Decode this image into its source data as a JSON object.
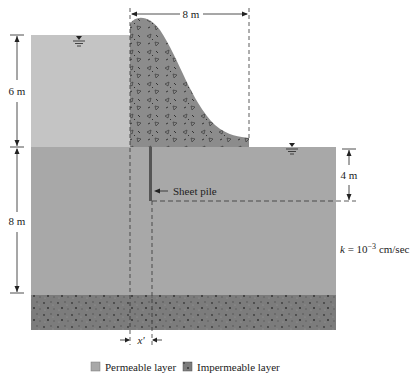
{
  "diagram": {
    "dimensions": {
      "dam_base_width": "8 m",
      "upstream_water_height": "6 m",
      "permeable_layer_thickness": "8 m",
      "sheet_pile_depth": "4 m",
      "offset_label": "x'"
    },
    "annotations": {
      "sheet_pile": "Sheet pile",
      "k_prefix": "k",
      "k_equals": " = 10",
      "k_exponent": "−3",
      "k_units": " cm/sec"
    },
    "symbols": {
      "water_table_upstream": "water-table-symbol",
      "water_table_downstream": "water-table-symbol"
    },
    "legend": {
      "items": [
        {
          "label": "Permeable layer",
          "color": "#a8a8a8"
        },
        {
          "label": "Impermeable layer",
          "color": "#6e6e6e"
        }
      ]
    },
    "colors": {
      "upstream_water": "#c4c4c4",
      "permeable_soil": "#a8a8a8",
      "dam_body": "#8a8a8a",
      "impermeable": "#7a7a7a",
      "line": "#222222"
    }
  }
}
